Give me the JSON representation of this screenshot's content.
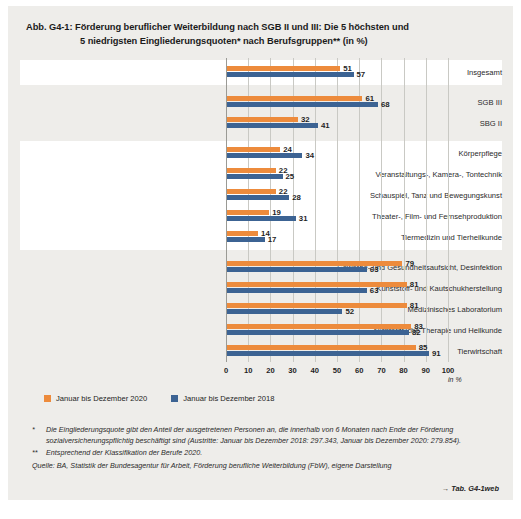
{
  "figure": {
    "title_line1": "Abb. G4-1:  Förderung beruflicher Weiterbildung nach SGB II und III: Die 5 höchsten und",
    "title_line2": "5 niedrigsten Eingliederungsquoten* nach Berufsgruppen** (in %)",
    "tab_reference": "→ Tab. G4-1web"
  },
  "legend": {
    "items": [
      {
        "label": "Januar bis Dezember 2020",
        "color": "#ED8B3C"
      },
      {
        "label": "Januar bis Dezember 2018",
        "color": "#3C6393"
      }
    ]
  },
  "notes": {
    "footnote1_mark": "*",
    "footnote1_text": "Die Eingliederungsquote gibt den Anteil der ausgetretenen Personen an, die innerhalb von 6 Monaten nach Ende der Förderung sozialversicherungspflichtig beschäftigt sind (Austritte: Januar bis Dezember 2018: 297.343, Januar bis Dezember 2020: 279.854).",
    "footnote2_mark": "**",
    "footnote2_text": "Entsprechend der Klassifikation der Berufe 2020.",
    "source": "Quelle: BA, Statistik der Bundesagentur für Arbeit, Förderung berufliche Weiterbildung (FbW), eigene Darstellung"
  },
  "chart_data": {
    "type": "bar",
    "orientation": "horizontal",
    "title": "Förderung beruflicher Weiterbildung nach SGB II und III: Die 5 höchsten und 5 niedrigsten Eingliederungsquoten* nach Berufsgruppen** (in %)",
    "xlabel": "in %",
    "ylabel": "",
    "xlim": [
      0,
      100
    ],
    "xticks": [
      0,
      10,
      20,
      30,
      40,
      50,
      60,
      70,
      80,
      90,
      100
    ],
    "grid": true,
    "legend_position": "bottom-left",
    "categories": [
      "Insgesamt",
      "SGB III",
      "SBG II",
      "Körperpflege",
      "Veranstaltungs-, Kamera-, Tontechnik",
      "Schauspiel, Tanz und Bewegungskunst",
      "Theater-, Film- und Fernsehproduktion",
      "Tiermedizin und Tierheilkunde",
      "Gewerbe- und Gesundheitsaufsicht, Desinfektion",
      "Kunststoff- und Kautschukherstellung",
      "Medizinisches Laboratorium",
      "Nichtärztliche Therapie und Heilkunde",
      "Tierwirtschaft"
    ],
    "series": [
      {
        "name": "Januar bis Dezember 2020",
        "color": "#ED8B3C",
        "values": [
          51,
          61,
          32,
          24,
          22,
          22,
          19,
          14,
          79,
          81,
          81,
          83,
          85
        ]
      },
      {
        "name": "Januar bis Dezember 2018",
        "color": "#3C6393",
        "values": [
          57,
          68,
          41,
          34,
          25,
          28,
          31,
          17,
          63,
          63,
          52,
          82,
          91
        ]
      }
    ],
    "groups": [
      {
        "name": "gesamt",
        "rows": [
          0
        ],
        "shade": "white"
      },
      {
        "name": "sgb",
        "rows": [
          1,
          2
        ],
        "shade": "grey"
      },
      {
        "name": "niedrigste",
        "rows": [
          3,
          4,
          5,
          6,
          7
        ],
        "shade": "white"
      },
      {
        "name": "hoechste",
        "rows": [
          8,
          9,
          10,
          11,
          12
        ],
        "shade": "grey"
      }
    ]
  }
}
